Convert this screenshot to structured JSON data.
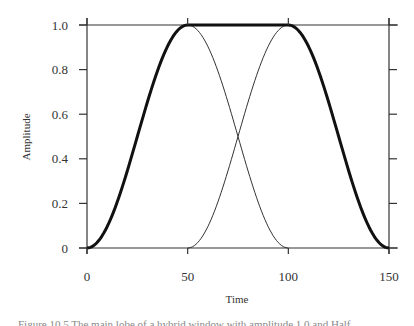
{
  "chart_data": {
    "type": "line",
    "title": "",
    "xlabel": "Time",
    "ylabel": "Amplitude",
    "xlim": [
      0,
      150
    ],
    "ylim": [
      0,
      1.0
    ],
    "x_ticks": [
      0,
      50,
      100,
      150
    ],
    "x_tick_labels": [
      "0",
      "50",
      "100",
      "150"
    ],
    "y_ticks": [
      0,
      0.2,
      0.4,
      0.6,
      0.8,
      1.0
    ],
    "y_tick_labels": [
      "0",
      "0.2",
      "0.4",
      "0.6",
      "0.8",
      "1.0"
    ],
    "grid": false,
    "legend": null,
    "series": [
      {
        "name": "hybrid window (thick)",
        "style": "thick",
        "x": [
          0,
          12.5,
          25,
          37.5,
          50,
          75,
          100,
          112.5,
          125,
          137.5,
          150
        ],
        "values": [
          0,
          0.146,
          0.5,
          0.854,
          1.0,
          1.0,
          1.0,
          0.854,
          0.5,
          0.146,
          0
        ]
      },
      {
        "name": "falling half-cosine (thin)",
        "style": "thin",
        "x": [
          50,
          62.5,
          75,
          87.5,
          100
        ],
        "values": [
          1.0,
          0.854,
          0.5,
          0.146,
          0
        ]
      },
      {
        "name": "rising half-cosine (thin)",
        "style": "thin",
        "x": [
          50,
          62.5,
          75,
          87.5,
          100
        ],
        "values": [
          0,
          0.146,
          0.5,
          0.854,
          1.0
        ]
      }
    ],
    "annotations": []
  },
  "caption": "Figure 10.5  The main lobe of a hybrid window with amplitude 1.0 and Half..."
}
